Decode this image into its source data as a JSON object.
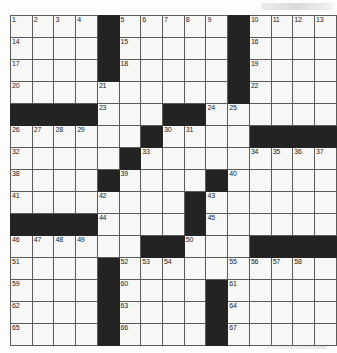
{
  "puzzle": {
    "type": "crossword-grid",
    "title": "Crossword Puzzle Grid",
    "rows": 15,
    "columns": 15,
    "cell_size_px": 21,
    "colors": {
      "block": "#232323",
      "cell": "#f7f7f5",
      "grid_line": "#5b5b5b",
      "number_text": "#1a1a1a",
      "page_background": "#fdfdfc"
    },
    "legend": {
      "block_label": "blocked-square",
      "open_label": "open-square"
    },
    "grid": [
      [
        {
          "block": false,
          "num": "1"
        },
        {
          "block": false,
          "num": "2"
        },
        {
          "block": false,
          "num": "3"
        },
        {
          "block": false,
          "num": "4"
        },
        {
          "block": true,
          "num": ""
        },
        {
          "block": false,
          "num": "5"
        },
        {
          "block": false,
          "num": "6"
        },
        {
          "block": false,
          "num": "7"
        },
        {
          "block": false,
          "num": "8"
        },
        {
          "block": false,
          "num": "9"
        },
        {
          "block": true,
          "num": ""
        },
        {
          "block": false,
          "num": "10"
        },
        {
          "block": false,
          "num": "11"
        },
        {
          "block": false,
          "num": "12"
        },
        {
          "block": false,
          "num": "13"
        }
      ],
      [
        {
          "block": false,
          "num": "14"
        },
        {
          "block": false,
          "num": ""
        },
        {
          "block": false,
          "num": ""
        },
        {
          "block": false,
          "num": ""
        },
        {
          "block": true,
          "num": ""
        },
        {
          "block": false,
          "num": "15"
        },
        {
          "block": false,
          "num": ""
        },
        {
          "block": false,
          "num": ""
        },
        {
          "block": false,
          "num": ""
        },
        {
          "block": false,
          "num": ""
        },
        {
          "block": true,
          "num": ""
        },
        {
          "block": false,
          "num": "16"
        },
        {
          "block": false,
          "num": ""
        },
        {
          "block": false,
          "num": ""
        },
        {
          "block": false,
          "num": ""
        }
      ],
      [
        {
          "block": false,
          "num": "17"
        },
        {
          "block": false,
          "num": ""
        },
        {
          "block": false,
          "num": ""
        },
        {
          "block": false,
          "num": ""
        },
        {
          "block": true,
          "num": ""
        },
        {
          "block": false,
          "num": "18"
        },
        {
          "block": false,
          "num": ""
        },
        {
          "block": false,
          "num": ""
        },
        {
          "block": false,
          "num": ""
        },
        {
          "block": false,
          "num": ""
        },
        {
          "block": true,
          "num": ""
        },
        {
          "block": false,
          "num": "19"
        },
        {
          "block": false,
          "num": ""
        },
        {
          "block": false,
          "num": ""
        },
        {
          "block": false,
          "num": ""
        }
      ],
      [
        {
          "block": false,
          "num": "20"
        },
        {
          "block": false,
          "num": ""
        },
        {
          "block": false,
          "num": ""
        },
        {
          "block": false,
          "num": ""
        },
        {
          "block": false,
          "num": "21"
        },
        {
          "block": false,
          "num": ""
        },
        {
          "block": false,
          "num": ""
        },
        {
          "block": false,
          "num": ""
        },
        {
          "block": false,
          "num": ""
        },
        {
          "block": false,
          "num": ""
        },
        {
          "block": true,
          "num": ""
        },
        {
          "block": false,
          "num": "22"
        },
        {
          "block": false,
          "num": ""
        },
        {
          "block": false,
          "num": ""
        },
        {
          "block": false,
          "num": ""
        }
      ],
      [
        {
          "block": true,
          "num": ""
        },
        {
          "block": true,
          "num": ""
        },
        {
          "block": true,
          "num": ""
        },
        {
          "block": true,
          "num": ""
        },
        {
          "block": false,
          "num": "23"
        },
        {
          "block": false,
          "num": ""
        },
        {
          "block": false,
          "num": ""
        },
        {
          "block": true,
          "num": ""
        },
        {
          "block": true,
          "num": ""
        },
        {
          "block": false,
          "num": "24"
        },
        {
          "block": false,
          "num": "25"
        },
        {
          "block": false,
          "num": ""
        },
        {
          "block": false,
          "num": ""
        },
        {
          "block": false,
          "num": ""
        },
        {
          "block": false,
          "num": ""
        }
      ],
      [
        {
          "block": false,
          "num": "26"
        },
        {
          "block": false,
          "num": "27"
        },
        {
          "block": false,
          "num": "28"
        },
        {
          "block": false,
          "num": "29"
        },
        {
          "block": false,
          "num": ""
        },
        {
          "block": false,
          "num": ""
        },
        {
          "block": true,
          "num": ""
        },
        {
          "block": false,
          "num": "30"
        },
        {
          "block": false,
          "num": "31"
        },
        {
          "block": false,
          "num": ""
        },
        {
          "block": false,
          "num": ""
        },
        {
          "block": true,
          "num": ""
        },
        {
          "block": true,
          "num": ""
        },
        {
          "block": true,
          "num": ""
        },
        {
          "block": true,
          "num": ""
        }
      ],
      [
        {
          "block": false,
          "num": "32"
        },
        {
          "block": false,
          "num": ""
        },
        {
          "block": false,
          "num": ""
        },
        {
          "block": false,
          "num": ""
        },
        {
          "block": false,
          "num": ""
        },
        {
          "block": true,
          "num": ""
        },
        {
          "block": false,
          "num": "33"
        },
        {
          "block": false,
          "num": ""
        },
        {
          "block": false,
          "num": ""
        },
        {
          "block": false,
          "num": ""
        },
        {
          "block": false,
          "num": ""
        },
        {
          "block": false,
          "num": "34"
        },
        {
          "block": false,
          "num": "35"
        },
        {
          "block": false,
          "num": "36"
        },
        {
          "block": false,
          "num": "37"
        }
      ],
      [
        {
          "block": false,
          "num": "38"
        },
        {
          "block": false,
          "num": ""
        },
        {
          "block": false,
          "num": ""
        },
        {
          "block": false,
          "num": ""
        },
        {
          "block": true,
          "num": ""
        },
        {
          "block": false,
          "num": "39"
        },
        {
          "block": false,
          "num": ""
        },
        {
          "block": false,
          "num": ""
        },
        {
          "block": false,
          "num": ""
        },
        {
          "block": true,
          "num": ""
        },
        {
          "block": false,
          "num": "40"
        },
        {
          "block": false,
          "num": ""
        },
        {
          "block": false,
          "num": ""
        },
        {
          "block": false,
          "num": ""
        },
        {
          "block": false,
          "num": ""
        }
      ],
      [
        {
          "block": false,
          "num": "41"
        },
        {
          "block": false,
          "num": ""
        },
        {
          "block": false,
          "num": ""
        },
        {
          "block": false,
          "num": ""
        },
        {
          "block": false,
          "num": "42"
        },
        {
          "block": false,
          "num": ""
        },
        {
          "block": false,
          "num": ""
        },
        {
          "block": false,
          "num": ""
        },
        {
          "block": true,
          "num": ""
        },
        {
          "block": false,
          "num": "43"
        },
        {
          "block": false,
          "num": ""
        },
        {
          "block": false,
          "num": ""
        },
        {
          "block": false,
          "num": ""
        },
        {
          "block": false,
          "num": ""
        },
        {
          "block": false,
          "num": ""
        }
      ],
      [
        {
          "block": true,
          "num": ""
        },
        {
          "block": true,
          "num": ""
        },
        {
          "block": true,
          "num": ""
        },
        {
          "block": true,
          "num": ""
        },
        {
          "block": false,
          "num": "44"
        },
        {
          "block": false,
          "num": ""
        },
        {
          "block": false,
          "num": ""
        },
        {
          "block": false,
          "num": ""
        },
        {
          "block": true,
          "num": ""
        },
        {
          "block": false,
          "num": "45"
        },
        {
          "block": false,
          "num": ""
        },
        {
          "block": false,
          "num": ""
        },
        {
          "block": false,
          "num": ""
        },
        {
          "block": false,
          "num": ""
        },
        {
          "block": false,
          "num": ""
        }
      ],
      [
        {
          "block": false,
          "num": "46"
        },
        {
          "block": false,
          "num": "47"
        },
        {
          "block": false,
          "num": "48"
        },
        {
          "block": false,
          "num": "49"
        },
        {
          "block": false,
          "num": ""
        },
        {
          "block": false,
          "num": ""
        },
        {
          "block": true,
          "num": ""
        },
        {
          "block": true,
          "num": ""
        },
        {
          "block": false,
          "num": "50"
        },
        {
          "block": false,
          "num": ""
        },
        {
          "block": false,
          "num": ""
        },
        {
          "block": true,
          "num": ""
        },
        {
          "block": true,
          "num": ""
        },
        {
          "block": true,
          "num": ""
        },
        {
          "block": true,
          "num": ""
        }
      ],
      [
        {
          "block": false,
          "num": "51"
        },
        {
          "block": false,
          "num": ""
        },
        {
          "block": false,
          "num": ""
        },
        {
          "block": false,
          "num": ""
        },
        {
          "block": true,
          "num": ""
        },
        {
          "block": false,
          "num": "52"
        },
        {
          "block": false,
          "num": "53"
        },
        {
          "block": false,
          "num": "54"
        },
        {
          "block": false,
          "num": ""
        },
        {
          "block": false,
          "num": ""
        },
        {
          "block": false,
          "num": "55"
        },
        {
          "block": false,
          "num": "56"
        },
        {
          "block": false,
          "num": "57"
        },
        {
          "block": false,
          "num": "58"
        },
        {
          "block": false,
          "num": ""
        }
      ],
      [
        {
          "block": false,
          "num": "59"
        },
        {
          "block": false,
          "num": ""
        },
        {
          "block": false,
          "num": ""
        },
        {
          "block": false,
          "num": ""
        },
        {
          "block": true,
          "num": ""
        },
        {
          "block": false,
          "num": "60"
        },
        {
          "block": false,
          "num": ""
        },
        {
          "block": false,
          "num": ""
        },
        {
          "block": false,
          "num": ""
        },
        {
          "block": true,
          "num": ""
        },
        {
          "block": false,
          "num": "61"
        },
        {
          "block": false,
          "num": ""
        },
        {
          "block": false,
          "num": ""
        },
        {
          "block": false,
          "num": ""
        },
        {
          "block": false,
          "num": ""
        }
      ],
      [
        {
          "block": false,
          "num": "62"
        },
        {
          "block": false,
          "num": ""
        },
        {
          "block": false,
          "num": ""
        },
        {
          "block": false,
          "num": ""
        },
        {
          "block": true,
          "num": ""
        },
        {
          "block": false,
          "num": "63"
        },
        {
          "block": false,
          "num": ""
        },
        {
          "block": false,
          "num": ""
        },
        {
          "block": false,
          "num": ""
        },
        {
          "block": true,
          "num": ""
        },
        {
          "block": false,
          "num": "64"
        },
        {
          "block": false,
          "num": ""
        },
        {
          "block": false,
          "num": ""
        },
        {
          "block": false,
          "num": ""
        },
        {
          "block": false,
          "num": ""
        }
      ],
      [
        {
          "block": false,
          "num": "65"
        },
        {
          "block": false,
          "num": ""
        },
        {
          "block": false,
          "num": ""
        },
        {
          "block": false,
          "num": ""
        },
        {
          "block": true,
          "num": ""
        },
        {
          "block": false,
          "num": "66"
        },
        {
          "block": false,
          "num": ""
        },
        {
          "block": false,
          "num": ""
        },
        {
          "block": false,
          "num": ""
        },
        {
          "block": true,
          "num": ""
        },
        {
          "block": false,
          "num": "67"
        },
        {
          "block": false,
          "num": ""
        },
        {
          "block": false,
          "num": ""
        },
        {
          "block": false,
          "num": ""
        },
        {
          "block": false,
          "num": ""
        }
      ]
    ]
  }
}
